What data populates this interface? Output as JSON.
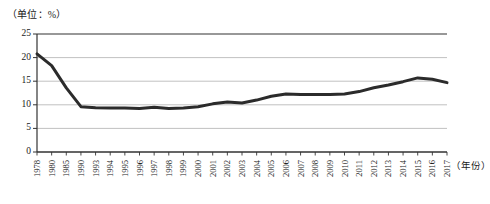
{
  "unit_caption": "（单位：%）",
  "xaxis_caption": "（年份）",
  "chart_data": {
    "type": "line",
    "title": "",
    "subtitle": "",
    "xlabel": "（年份）",
    "ylabel": "（单位：%）",
    "ylim": [
      0,
      25
    ],
    "yticks": [
      0,
      5,
      10,
      15,
      20,
      25
    ],
    "ytick_labels": [
      "0",
      "5",
      "10",
      "15",
      "20",
      "25"
    ],
    "grid": true,
    "grid_axis": "y",
    "legend": false,
    "legend_position": "none",
    "line_color": "#2b2b2b",
    "line_width": 3,
    "grid_color": "#a6a6a6",
    "axis_color": "#555555",
    "categories": [
      "1978",
      "1980",
      "1985",
      "1990",
      "1993",
      "1994",
      "1995",
      "1996",
      "1997",
      "1998",
      "1999",
      "2000",
      "2001",
      "2002",
      "2003",
      "2004",
      "2005",
      "2006",
      "2007",
      "2008",
      "2009",
      "2010",
      "2011",
      "2012",
      "2013",
      "2014",
      "2015",
      "2016",
      "2017"
    ],
    "values": [
      20.8,
      18.3,
      13.6,
      9.6,
      9.4,
      9.3,
      9.3,
      9.2,
      9.5,
      9.2,
      9.3,
      9.6,
      10.2,
      10.6,
      10.4,
      11.0,
      11.8,
      12.3,
      12.2,
      12.2,
      12.2,
      12.3,
      12.8,
      13.6,
      14.2,
      14.9,
      15.7,
      15.4,
      14.7
    ],
    "series": [
      {
        "name": "",
        "values": [
          20.8,
          18.3,
          13.6,
          9.6,
          9.4,
          9.3,
          9.3,
          9.2,
          9.5,
          9.2,
          9.3,
          9.6,
          10.2,
          10.6,
          10.4,
          11.0,
          11.8,
          12.3,
          12.2,
          12.2,
          12.2,
          12.3,
          12.8,
          13.6,
          14.2,
          14.9,
          15.7,
          15.4,
          14.7
        ]
      }
    ],
    "annotations": []
  }
}
